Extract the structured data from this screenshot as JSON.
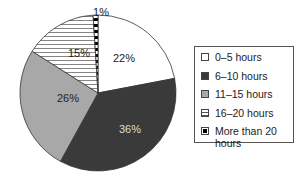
{
  "chart_data": {
    "type": "pie",
    "title": "",
    "categories": [
      "0–5 hours",
      "6–10 hours",
      "11–15 hours",
      "16–20 hours",
      "More than 20 hours"
    ],
    "values": [
      22,
      36,
      26,
      15,
      1
    ],
    "labels": [
      "22%",
      "36%",
      "26%",
      "15%",
      "1%"
    ],
    "units": "%",
    "start_angle": "12 o'clock",
    "direction": "clockwise",
    "fills": [
      "white",
      "dark gray #3a3a3a",
      "medium gray #a8a8a8",
      "horizontal hatch",
      "black/white dotted"
    ],
    "legend_position": "right"
  },
  "legend": {
    "items": [
      {
        "label": "0–5 hours",
        "fill": "white"
      },
      {
        "label": "6–10 hours",
        "fill": "dark"
      },
      {
        "label": "11–15 hours",
        "fill": "gray"
      },
      {
        "label": "16–20 hours",
        "fill": "hatch"
      },
      {
        "label": "More than 20 hours",
        "fill": "dot"
      }
    ]
  },
  "colors": {
    "white": "#ffffff",
    "dark": "#3a3a3a",
    "gray": "#a8a8a8",
    "outline": "#333333"
  }
}
